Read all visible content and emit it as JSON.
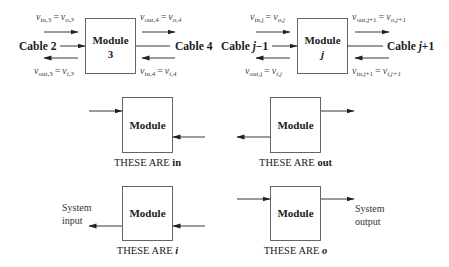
{
  "diagram": {
    "top_left": {
      "module_label": "Module",
      "module_number": "3",
      "left_cable": "Cable 2",
      "right_cable": "Cable 4",
      "eq_top_left": {
        "lhs": "v",
        "lhs_sub": "in,3",
        "rhs": "v",
        "rhs_sub": "o,3"
      },
      "eq_bottom_left": {
        "lhs": "v",
        "lhs_sub": "out,3",
        "rhs": "v",
        "rhs_sub": "i,3"
      },
      "eq_top_right": {
        "lhs": "v",
        "lhs_sub": "out,4",
        "rhs": "v",
        "rhs_sub": "o,4"
      },
      "eq_bottom_right": {
        "lhs": "v",
        "lhs_sub": "in,4",
        "rhs": "v",
        "rhs_sub": "i,4"
      }
    },
    "top_right": {
      "module_label": "Module",
      "module_number": "j",
      "left_cable_prefix": "Cable ",
      "left_cable_var": "j",
      "left_cable_suffix": "−1",
      "right_cable_prefix": "Cable ",
      "right_cable_var": "j",
      "right_cable_suffix": "+1",
      "eq_top_left": {
        "lhs": "v",
        "lhs_sub": "in,j",
        "rhs": "v",
        "rhs_sub": "o,j"
      },
      "eq_bottom_left": {
        "lhs": "v",
        "lhs_sub": "out,j",
        "rhs": "v",
        "rhs_sub": "i,j"
      },
      "eq_top_right": {
        "lhs": "v",
        "lhs_sub": "out,j+1",
        "rhs": "v",
        "rhs_sub": "o,j+1"
      },
      "eq_bottom_right": {
        "lhs": "v",
        "lhs_sub": "in,j+1",
        "rhs": "v",
        "rhs_sub": "i,j+1"
      }
    },
    "equals": "=",
    "middle_left": {
      "module_label": "Module",
      "caption_prefix": "THESE ARE ",
      "caption_key": "in"
    },
    "middle_right": {
      "module_label": "Module",
      "caption_prefix": "THESE ARE ",
      "caption_key": "out"
    },
    "bottom_left": {
      "module_label": "Module",
      "caption_prefix": "THESE ARE ",
      "caption_key": "i",
      "side_label_line1": "System",
      "side_label_line2": "input"
    },
    "bottom_right": {
      "module_label": "Module",
      "caption_prefix": "THESE ARE ",
      "caption_key": "o",
      "side_label_line1": "System",
      "side_label_line2": "output"
    }
  }
}
